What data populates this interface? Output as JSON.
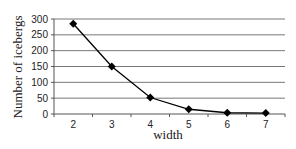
{
  "chart_data": {
    "type": "line",
    "title": "",
    "xlabel": "width",
    "ylabel": "Number of icebergs",
    "x": [
      2,
      3,
      4,
      5,
      6,
      7
    ],
    "series": [
      {
        "name": "Number of icebergs",
        "values": [
          285,
          150,
          52,
          15,
          4,
          3
        ],
        "marker": "diamond",
        "color": "#000000"
      }
    ],
    "xticks": [
      "2",
      "3",
      "4",
      "5",
      "6",
      "7"
    ],
    "yticks": [
      0,
      50,
      100,
      150,
      200,
      250,
      300
    ],
    "ylim": [
      0,
      300
    ],
    "grid": "horizontal",
    "legend": "none"
  }
}
